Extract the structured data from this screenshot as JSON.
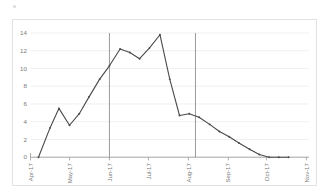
{
  "chart_data": {
    "type": "line",
    "title": "",
    "xlabel": "",
    "ylabel": "",
    "ylim": [
      0,
      14
    ],
    "ytick_labels": [
      "0",
      "2",
      "4",
      "6",
      "8",
      "10",
      "12",
      "14"
    ],
    "ytick_values": [
      0,
      2,
      4,
      6,
      8,
      10,
      12,
      14
    ],
    "grid": true,
    "legend": "none",
    "xtick_labels": [
      "Apr-17",
      "May-17",
      "Jun-17",
      "Jul-17",
      "Aug-17",
      "Sep-17",
      "Oct-17",
      "Nov-17"
    ],
    "xtick_positions": [
      0,
      4.4,
      8.9,
      13.3,
      17.8,
      22.3,
      26.6,
      31.1
    ],
    "x": [
      0.9,
      2.2,
      3.2,
      4.4,
      5.5,
      6.6,
      7.8,
      8.9,
      10.1,
      11.2,
      12.3,
      13.4,
      14.6,
      15.7,
      16.8,
      17.9,
      19.0,
      20.2,
      21.3,
      22.4,
      23.5,
      24.7,
      25.8,
      26.9,
      28.0,
      29.1
    ],
    "values": [
      0.0,
      3.3,
      5.5,
      3.6,
      4.9,
      6.8,
      8.8,
      10.3,
      12.2,
      11.8,
      11.1,
      12.3,
      13.8,
      8.8,
      4.7,
      4.9,
      4.5,
      3.7,
      2.9,
      2.3,
      1.6,
      0.9,
      0.3,
      0.0,
      0.0,
      0.0
    ],
    "annotations": [
      {
        "name": "reference-line-1",
        "type": "vertical-line",
        "x": 8.9,
        "label": "Jun-17"
      },
      {
        "name": "reference-line-2",
        "type": "vertical-line",
        "x": 18.6,
        "label": ""
      }
    ],
    "series_color": "#4a4a4a",
    "gridline_color": "#e9e9e9",
    "axis_color": "#9a9a9a",
    "reference_line_color": "#8e8e8e"
  }
}
